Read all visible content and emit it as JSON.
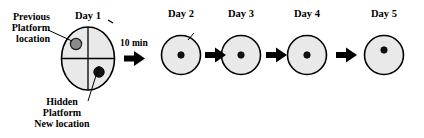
{
  "figure": {
    "type": "morris-water-maze-protocol",
    "colors": {
      "pool_fill": "#e9e9e9",
      "pool_stroke": "#000000",
      "previous_platform_fill": "#8a8a8a",
      "new_platform_fill": "#111111",
      "arrow": "#000000",
      "text": "#000000"
    }
  },
  "annotations": {
    "previous_platform": {
      "line1": "Previous",
      "line2": "Platform",
      "line3": "location"
    },
    "hidden_platform": {
      "line1": "Hidden",
      "line2": "Platform",
      "line3": "New location"
    },
    "interval": "10 min"
  },
  "days": [
    {
      "id": "day-1",
      "label": "Day 1",
      "quadrants": true,
      "platforms": [
        {
          "kind": "previous",
          "position": "upper-left"
        },
        {
          "kind": "new-hidden",
          "position": "lower-right"
        }
      ]
    },
    {
      "id": "day-2",
      "label": "Day 2",
      "quadrants": false,
      "platforms": [
        {
          "kind": "new-hidden",
          "position": "center"
        }
      ]
    },
    {
      "id": "day-3",
      "label": "Day 3",
      "quadrants": false,
      "platforms": [
        {
          "kind": "new-hidden",
          "position": "center"
        }
      ]
    },
    {
      "id": "day-4",
      "label": "Day 4",
      "quadrants": false,
      "platforms": [
        {
          "kind": "new-hidden",
          "position": "center"
        }
      ]
    },
    {
      "id": "day-5",
      "label": "Day 5",
      "quadrants": false,
      "platforms": [
        {
          "kind": "new-hidden",
          "position": "center"
        }
      ]
    }
  ],
  "arrows": [
    {
      "id": "arrow-1",
      "from": "day-1",
      "to": "day-2",
      "caption": "10 min"
    },
    {
      "id": "arrow-2",
      "from": "day-2",
      "to": "day-3",
      "caption": ""
    },
    {
      "id": "arrow-3",
      "from": "day-3",
      "to": "day-4",
      "caption": ""
    },
    {
      "id": "arrow-4",
      "from": "day-4",
      "to": "day-5",
      "caption": ""
    }
  ]
}
